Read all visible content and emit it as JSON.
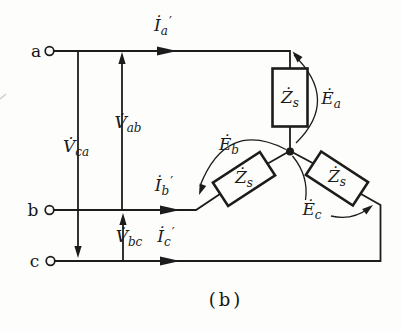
{
  "figure": {
    "type": "three-phase-circuit-diagram",
    "caption": "(b)"
  },
  "colors": {
    "line": "#1c1c1c",
    "background": "#fdfdfc"
  },
  "terminals": {
    "a": "a",
    "b": "b",
    "c": "c"
  },
  "labels": {
    "current_a": {
      "base": "İ",
      "sub": "a",
      "prime": "′"
    },
    "current_b": {
      "base": "İ",
      "sub": "b",
      "prime": "′"
    },
    "current_c": {
      "base": "İ",
      "sub": "c",
      "prime": "′"
    },
    "voltage_ab": {
      "base": "V̇",
      "sub": "ab"
    },
    "voltage_ca": {
      "base": "V̇",
      "sub": "ca"
    },
    "voltage_bc": {
      "base": "V̇",
      "sub": "bc"
    },
    "impedance_a": {
      "base": "Ż",
      "sub": "s"
    },
    "impedance_b": {
      "base": "Ż",
      "sub": "s"
    },
    "impedance_c": {
      "base": "Ż",
      "sub": "s"
    },
    "emf_a": {
      "base": "Ė",
      "sub": "a"
    },
    "emf_b": {
      "base": "Ė",
      "sub": "b"
    },
    "emf_c": {
      "base": "Ė",
      "sub": "c"
    }
  }
}
